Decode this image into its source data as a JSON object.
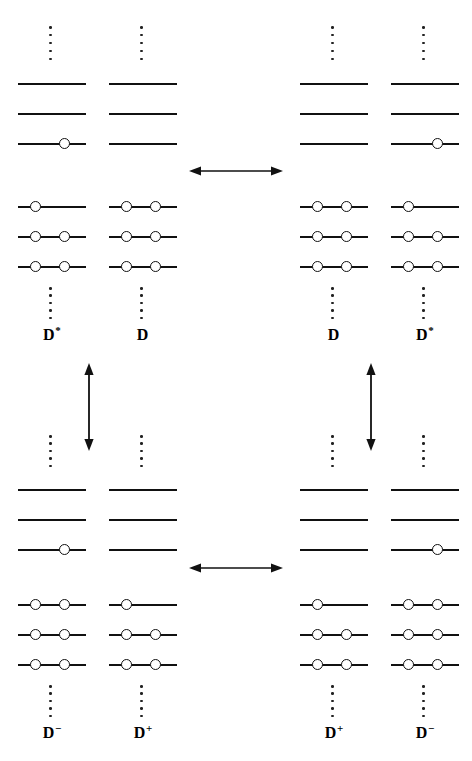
{
  "diagram": {
    "colors": {
      "line": "#111111",
      "electron_stroke": "#111111",
      "electron_fill": "#ffffff",
      "dot": "#222222",
      "background": "#ffffff"
    },
    "geometry": {
      "level_length": 68,
      "level_spacing": 30,
      "electron_diameter": 11
    },
    "quadrants": [
      {
        "id": "upper-left",
        "name": "excited-state-configuration-DstarD",
        "monomers": [
          {
            "name": "monomer-d-star-left",
            "label": "D",
            "superscript": "*",
            "label_full": "D*",
            "virtual_levels": [
              {
                "index": 0,
                "electrons": []
              },
              {
                "index": 1,
                "electrons": []
              },
              {
                "index": 2,
                "electrons": [
                  "right"
                ]
              }
            ],
            "occupied_levels": [
              {
                "index": 0,
                "electrons": [
                  "left"
                ]
              },
              {
                "index": 1,
                "electrons": [
                  "left",
                  "right"
                ]
              },
              {
                "index": 2,
                "electrons": [
                  "left",
                  "right"
                ]
              }
            ]
          },
          {
            "name": "monomer-d-right",
            "label": "D",
            "superscript": "",
            "label_full": "D",
            "virtual_levels": [
              {
                "index": 0,
                "electrons": []
              },
              {
                "index": 1,
                "electrons": []
              },
              {
                "index": 2,
                "electrons": []
              }
            ],
            "occupied_levels": [
              {
                "index": 0,
                "electrons": [
                  "left",
                  "right"
                ]
              },
              {
                "index": 1,
                "electrons": [
                  "left",
                  "right"
                ]
              },
              {
                "index": 2,
                "electrons": [
                  "left",
                  "right"
                ]
              }
            ]
          }
        ]
      },
      {
        "id": "upper-right",
        "name": "excited-state-configuration-DDstar",
        "monomers": [
          {
            "name": "monomer-d-left",
            "label": "D",
            "superscript": "",
            "label_full": "D",
            "virtual_levels": [
              {
                "index": 0,
                "electrons": []
              },
              {
                "index": 1,
                "electrons": []
              },
              {
                "index": 2,
                "electrons": []
              }
            ],
            "occupied_levels": [
              {
                "index": 0,
                "electrons": [
                  "left",
                  "right"
                ]
              },
              {
                "index": 1,
                "electrons": [
                  "left",
                  "right"
                ]
              },
              {
                "index": 2,
                "electrons": [
                  "left",
                  "right"
                ]
              }
            ]
          },
          {
            "name": "monomer-d-star-right",
            "label": "D",
            "superscript": "*",
            "label_full": "D*",
            "virtual_levels": [
              {
                "index": 0,
                "electrons": []
              },
              {
                "index": 1,
                "electrons": []
              },
              {
                "index": 2,
                "electrons": [
                  "right"
                ]
              }
            ],
            "occupied_levels": [
              {
                "index": 0,
                "electrons": [
                  "left"
                ]
              },
              {
                "index": 1,
                "electrons": [
                  "left",
                  "right"
                ]
              },
              {
                "index": 2,
                "electrons": [
                  "left",
                  "right"
                ]
              }
            ]
          }
        ]
      },
      {
        "id": "lower-left",
        "name": "charge-transfer-configuration-DminusDplus",
        "monomers": [
          {
            "name": "monomer-d-minus-left",
            "label": "D",
            "superscript": "−",
            "label_full": "D−",
            "virtual_levels": [
              {
                "index": 0,
                "electrons": []
              },
              {
                "index": 1,
                "electrons": []
              },
              {
                "index": 2,
                "electrons": [
                  "right"
                ]
              }
            ],
            "occupied_levels": [
              {
                "index": 0,
                "electrons": [
                  "left",
                  "right"
                ]
              },
              {
                "index": 1,
                "electrons": [
                  "left",
                  "right"
                ]
              },
              {
                "index": 2,
                "electrons": [
                  "left",
                  "right"
                ]
              }
            ]
          },
          {
            "name": "monomer-d-plus-right",
            "label": "D",
            "superscript": "+",
            "label_full": "D+",
            "virtual_levels": [
              {
                "index": 0,
                "electrons": []
              },
              {
                "index": 1,
                "electrons": []
              },
              {
                "index": 2,
                "electrons": []
              }
            ],
            "occupied_levels": [
              {
                "index": 0,
                "electrons": [
                  "left"
                ]
              },
              {
                "index": 1,
                "electrons": [
                  "left",
                  "right"
                ]
              },
              {
                "index": 2,
                "electrons": [
                  "left",
                  "right"
                ]
              }
            ]
          }
        ]
      },
      {
        "id": "lower-right",
        "name": "charge-transfer-configuration-DplusDminus",
        "monomers": [
          {
            "name": "monomer-d-plus-left",
            "label": "D",
            "superscript": "+",
            "label_full": "D+",
            "virtual_levels": [
              {
                "index": 0,
                "electrons": []
              },
              {
                "index": 1,
                "electrons": []
              },
              {
                "index": 2,
                "electrons": []
              }
            ],
            "occupied_levels": [
              {
                "index": 0,
                "electrons": [
                  "left"
                ]
              },
              {
                "index": 1,
                "electrons": [
                  "left",
                  "right"
                ]
              },
              {
                "index": 2,
                "electrons": [
                  "left",
                  "right"
                ]
              }
            ]
          },
          {
            "name": "monomer-d-minus-right",
            "label": "D",
            "superscript": "−",
            "label_full": "D−",
            "virtual_levels": [
              {
                "index": 0,
                "electrons": []
              },
              {
                "index": 1,
                "electrons": []
              },
              {
                "index": 2,
                "electrons": [
                  "right"
                ]
              }
            ],
            "occupied_levels": [
              {
                "index": 0,
                "electrons": [
                  "left",
                  "right"
                ]
              },
              {
                "index": 1,
                "electrons": [
                  "left",
                  "right"
                ]
              },
              {
                "index": 2,
                "electrons": [
                  "left",
                  "right"
                ]
              }
            ]
          }
        ]
      }
    ],
    "arrows": [
      {
        "name": "resonance-arrow-top-horizontal",
        "orientation": "horizontal",
        "double_headed": true
      },
      {
        "name": "resonance-arrow-bottom-horizontal",
        "orientation": "horizontal",
        "double_headed": true
      },
      {
        "name": "resonance-arrow-left-vertical",
        "orientation": "vertical",
        "double_headed": true
      },
      {
        "name": "resonance-arrow-right-vertical",
        "orientation": "vertical",
        "double_headed": true
      }
    ]
  }
}
